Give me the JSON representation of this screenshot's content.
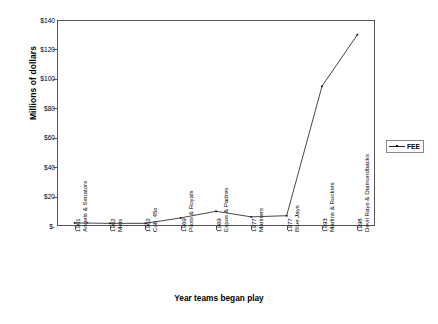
{
  "chart_data": {
    "type": "line",
    "title": "",
    "xlabel": "Year teams began play",
    "ylabel": "Millions of dollars",
    "ylim": [
      0,
      140
    ],
    "grid": false,
    "legend_position": "right",
    "y_ticks": [
      "$-",
      "$20",
      "$40",
      "$60",
      "$80",
      "$100",
      "$120",
      "$140"
    ],
    "y_tick_values": [
      0,
      20,
      40,
      60,
      80,
      100,
      120,
      140
    ],
    "categories": [
      {
        "year": "1961",
        "teams": "Angels & Senators"
      },
      {
        "year": "1962",
        "teams": "Mets"
      },
      {
        "year": "1962",
        "teams": "Colt .45s"
      },
      {
        "year": "1969",
        "teams": "Pilots & Royals"
      },
      {
        "year": "1969",
        "teams": "Expos & Padres"
      },
      {
        "year": "1977",
        "teams": "Mariners"
      },
      {
        "year": "1977",
        "teams": "Blue Jays"
      },
      {
        "year": "1993",
        "teams": "Marlins & Rockies"
      },
      {
        "year": "1998",
        "teams": "Devil Rays & Diamondbacks"
      }
    ],
    "series": [
      {
        "name": "FEE",
        "values": [
          2.1,
          1.8,
          1.8,
          5.5,
          10.0,
          6.2,
          7.0,
          95.0,
          130.0
        ]
      }
    ]
  },
  "legend": {
    "entries": [
      {
        "label": "FEE"
      }
    ]
  },
  "axes": {
    "y_title": "Millions of dollars",
    "x_title": "Year teams began play"
  }
}
